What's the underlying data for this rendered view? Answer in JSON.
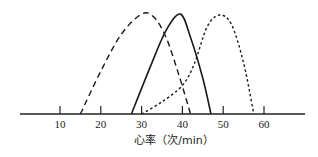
{
  "chart_data": {
    "type": "line",
    "title": "",
    "xlabel": "心率（次/min）",
    "ylabel": "",
    "xlim": [
      0,
      68
    ],
    "ylim": [
      0,
      1
    ],
    "grid": false,
    "legend": null,
    "xticks": [
      10,
      20,
      30,
      40,
      50,
      60
    ],
    "xtick_labels": [
      "10",
      "20",
      "30",
      "40",
      "50",
      "60"
    ],
    "series": [
      {
        "name": "dashed-curve",
        "style": "dashed",
        "x": [
          15,
          20,
          25,
          30,
          33,
          36,
          39,
          42
        ],
        "y": [
          0,
          0.42,
          0.78,
          0.98,
          0.95,
          0.75,
          0.4,
          0
        ]
      },
      {
        "name": "solid-curve",
        "style": "solid",
        "x": [
          27.5,
          32,
          36,
          39.5,
          42,
          45,
          47
        ],
        "y": [
          0,
          0.45,
          0.82,
          0.98,
          0.75,
          0.35,
          0
        ]
      },
      {
        "name": "dotted-curve",
        "style": "dotted",
        "x": [
          30,
          35,
          40,
          43,
          46,
          49,
          52,
          55,
          57.5
        ],
        "y": [
          0,
          0.12,
          0.28,
          0.5,
          0.85,
          0.97,
          0.88,
          0.5,
          0
        ]
      }
    ]
  }
}
